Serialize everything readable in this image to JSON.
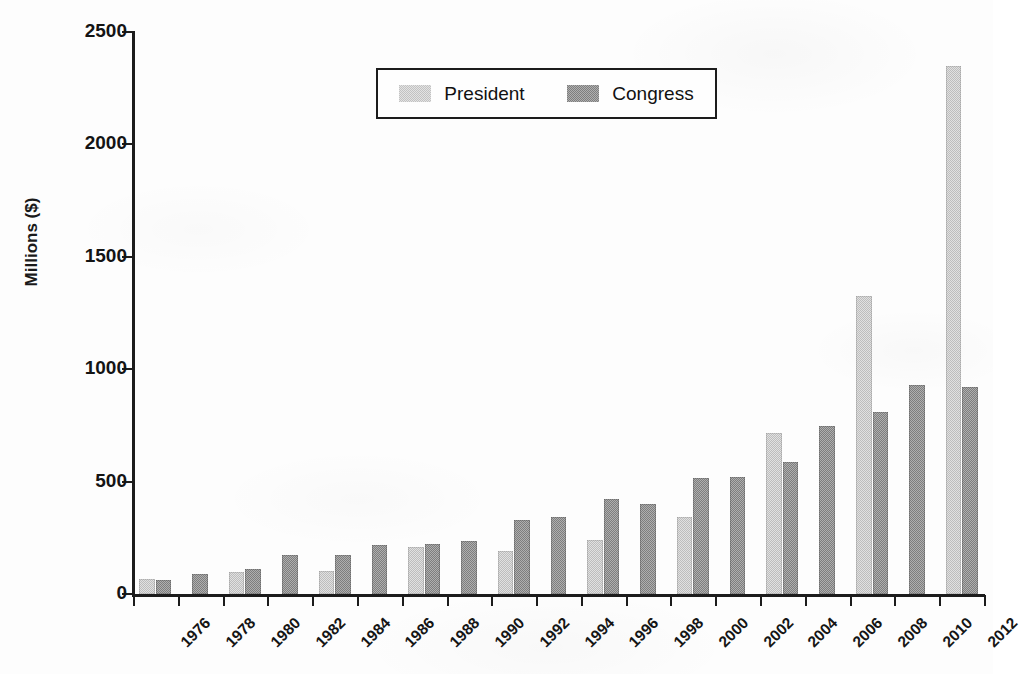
{
  "chart_data": {
    "type": "bar",
    "title": "",
    "subtitle": "",
    "xlabel": "",
    "ylabel": "Millions ($)",
    "ylim": [
      0,
      2500
    ],
    "yticks": [
      0,
      500,
      1000,
      1500,
      2000,
      2500
    ],
    "ytick_labels": [
      "0",
      "500",
      "1000",
      "1500",
      "2000",
      "2500"
    ],
    "grid": false,
    "legend_position": "top-center",
    "categories": [
      "1976",
      "1978",
      "1980",
      "1982",
      "1984",
      "1986",
      "1988",
      "1990",
      "1992",
      "1994",
      "1996",
      "1998",
      "2000",
      "2002",
      "2004",
      "2006",
      "2008",
      "2010",
      "2012"
    ],
    "series": [
      {
        "name": "President",
        "color": "#bdbdbd",
        "values": [
          67,
          null,
          96,
          null,
          104,
          null,
          211,
          null,
          192,
          null,
          240,
          null,
          343,
          null,
          718,
          null,
          1324,
          null,
          2347
        ]
      },
      {
        "name": "Congress",
        "color": "#7e7e7e",
        "values": [
          61,
          89,
          113,
          175,
          172,
          218,
          222,
          238,
          331,
          343,
          421,
          399,
          516,
          521,
          586,
          749,
          809,
          930,
          920
        ]
      }
    ]
  },
  "legend": {
    "entries": [
      {
        "label": "President",
        "swatch": "president-swatch",
        "color": "#bdbdbd"
      },
      {
        "label": "Congress",
        "swatch": "congress-swatch",
        "color": "#7e7e7e"
      }
    ]
  },
  "axis": {
    "y_title": "Millions ($)"
  }
}
